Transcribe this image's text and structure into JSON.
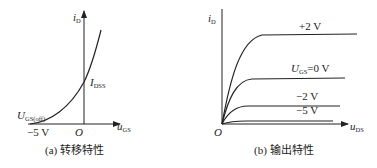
{
  "left_diagram": {
    "caption": "(a) 转移特性",
    "y_axis": {
      "symbol": "i",
      "subscript": "D"
    },
    "x_axis": {
      "symbol": "u",
      "subscript": "GS"
    },
    "origin": "O",
    "point_idss": {
      "symbol": "I",
      "subscript": "DSS"
    },
    "point_cutoff": {
      "symbol": "U",
      "subscript": "GS(off)"
    },
    "cutoff_value": "−5 V"
  },
  "right_diagram": {
    "caption": "(b) 输出特性",
    "y_axis": {
      "symbol": "i",
      "subscript": "D"
    },
    "x_axis": {
      "symbol": "u",
      "subscript": "DS"
    },
    "origin": "O",
    "curves": [
      {
        "label": "+2 V"
      },
      {
        "label_symbol": "U",
        "label_subscript": "GS",
        "label": "=0 V"
      },
      {
        "label": "−2 V"
      },
      {
        "label": "−5 V"
      }
    ]
  }
}
